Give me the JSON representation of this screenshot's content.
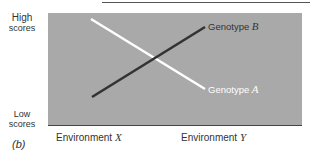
{
  "figure": {
    "panel_label": "(b)",
    "y_axis": {
      "high_line1": "High",
      "high_line2": "scores",
      "low_line1": "Low",
      "low_line2": "scores"
    },
    "x_axis": {
      "env1_prefix": "Environment ",
      "env1_var": "X",
      "env2_prefix": "Environment ",
      "env2_var": "Y"
    },
    "series": [
      {
        "name": "Genotype A",
        "prefix": "Genotype ",
        "var": "A",
        "color": "#ffffff",
        "points": [
          {
            "env": "X",
            "score": "high"
          },
          {
            "env": "Y",
            "score": "low"
          }
        ]
      },
      {
        "name": "Genotype B",
        "prefix": "Genotype ",
        "var": "B",
        "color": "#333333",
        "points": [
          {
            "env": "X",
            "score": "low"
          },
          {
            "env": "Y",
            "score": "high"
          }
        ]
      }
    ],
    "colors": {
      "plot_bg": "#a9a9a9",
      "axis": "#444444"
    }
  }
}
